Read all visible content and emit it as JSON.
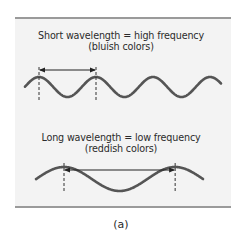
{
  "figure": {
    "caption": "(a)",
    "panel_color": "#f3f3f3",
    "wave_color": "#555555",
    "rule_color": "#9a9a9a"
  },
  "short_wave": {
    "title": "Short wavelength = high frequency",
    "subtitle": "(bluish colors)",
    "relative_wavelength": 1,
    "cycles_shown": 3.5
  },
  "long_wave": {
    "title": "Long wavelength = low frequency",
    "subtitle": "(reddish colors)",
    "relative_wavelength": 1.95,
    "cycles_shown": 1.5
  }
}
